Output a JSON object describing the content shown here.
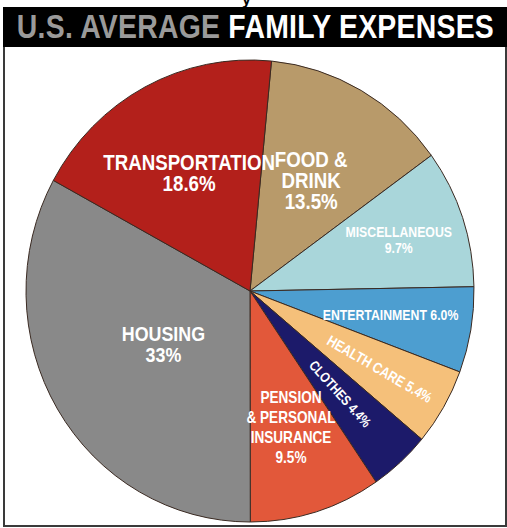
{
  "header": {
    "title_part1": "U.S. AVERAGE",
    "title_part2": "FAMILY EXPENSES",
    "top_fragment": "y"
  },
  "chart_data": {
    "type": "pie",
    "title": "U.S. AVERAGE FAMILY EXPENSES",
    "start_angle_deg": 5.5,
    "direction": "clockwise",
    "legend": "none (labels inside slices)",
    "slices": [
      {
        "name": "Food & Drink",
        "value": 13.5,
        "color": "#b89a6a",
        "label_lines": [
          "FOOD &",
          "DRINK",
          "13.5%"
        ]
      },
      {
        "name": "Miscellaneous",
        "value": 9.7,
        "color": "#a9d6da",
        "label_lines": [
          "MISCELLANEOUS",
          "9.7%"
        ]
      },
      {
        "name": "Entertainment",
        "value": 6.0,
        "color": "#4d9ed0",
        "label_lines": [
          "ENTERTAINMENT 6.0%"
        ]
      },
      {
        "name": "Health Care",
        "value": 5.4,
        "color": "#f5c07a",
        "label_lines": [
          "HEALTH CARE 5.4%"
        ]
      },
      {
        "name": "Clothes",
        "value": 4.4,
        "color": "#1c1a6a",
        "label_lines": [
          "CLOTHES 4.4%"
        ]
      },
      {
        "name": "Pension & Personal Insurance",
        "value": 9.5,
        "color": "#e2583a",
        "label_lines": [
          "PENSION",
          "& PERSONAL",
          "INSURANCE",
          "9.5%"
        ]
      },
      {
        "name": "Housing",
        "value": 33,
        "color": "#898989",
        "label_lines": [
          "HOUSING",
          "33%"
        ]
      },
      {
        "name": "Transportation",
        "value": 18.6,
        "color": "#b3201b",
        "label_lines": [
          "TRANSPORTATION",
          "18.6%"
        ]
      }
    ]
  }
}
